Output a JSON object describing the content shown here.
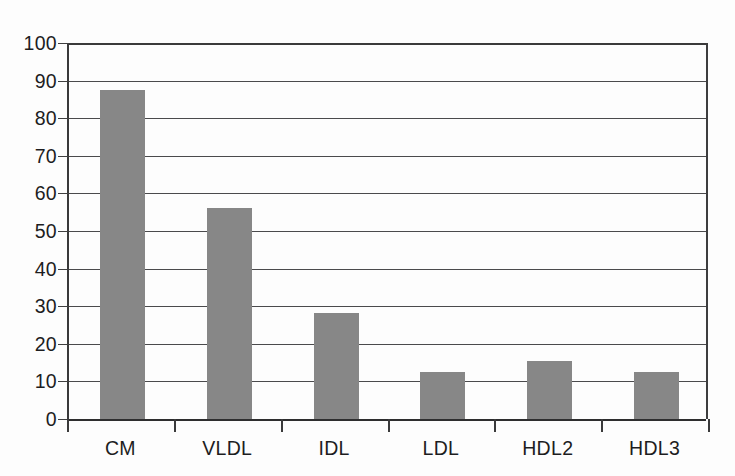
{
  "chart_data": {
    "type": "bar",
    "title": "",
    "subtitle": "",
    "xlabel": "",
    "ylabel": "",
    "categories": [
      "CM",
      "VLDL",
      "IDL",
      "LDL",
      "HDL2",
      "HDL3"
    ],
    "values": [
      87.6,
      56.2,
      28.2,
      12.6,
      15.5,
      12.4
    ],
    "series": [
      {
        "name": "",
        "values": [
          87.6,
          56.2,
          28.2,
          12.6,
          15.5,
          12.4
        ]
      }
    ],
    "ylim": [
      0,
      100
    ],
    "ytick_labels": [
      "100",
      "90",
      "80",
      "70",
      "60",
      "50",
      "40",
      "30",
      "20",
      "10",
      "0"
    ],
    "ytick_values": [
      100,
      90,
      80,
      70,
      60,
      50,
      40,
      30,
      20,
      10,
      0
    ],
    "grid": "horizontal",
    "legend": "none",
    "bar_color": "#878787",
    "axis_color": "#3a3a3b",
    "background_color": "#fdfdfd",
    "annotations": []
  }
}
